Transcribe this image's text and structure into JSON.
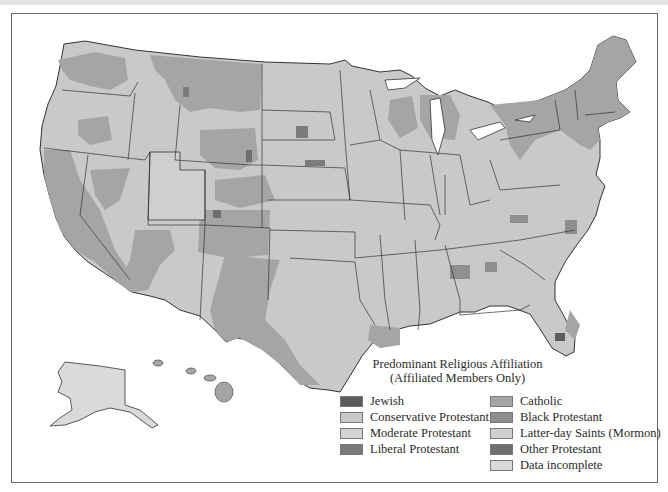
{
  "legend": {
    "title_line1": "Predominant Religious Affiliation",
    "title_line2": "(Affiliated Members Only)",
    "items": [
      {
        "label": "Jewish",
        "color": "#5d5d5d"
      },
      {
        "label": "Conservative Protestant",
        "color": "#c9c9c9"
      },
      {
        "label": "Moderate Protestant",
        "color": "#d3d3d3"
      },
      {
        "label": "Liberal Protestant",
        "color": "#7b7b7b"
      },
      {
        "label": "Catholic",
        "color": "#a5a5a5"
      },
      {
        "label": "Black Protestant",
        "color": "#8e8e8e"
      },
      {
        "label": "Latter-day Saints (Mormon)",
        "color": "#cfcfcf"
      },
      {
        "label": "Other Protestant",
        "color": "#6f6f6f"
      },
      {
        "label": "Data incomplete",
        "color": "#dadada"
      }
    ]
  },
  "map": {
    "subject": "United States counties",
    "insets": [
      "Alaska",
      "Hawaii"
    ]
  }
}
